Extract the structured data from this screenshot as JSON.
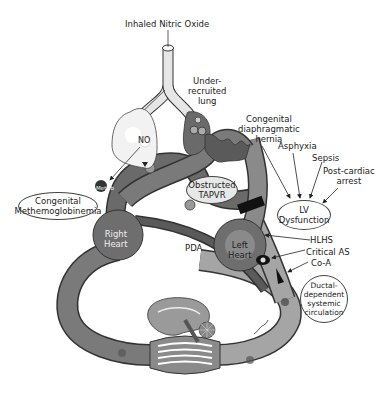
{
  "diagram": {
    "labels": {
      "inhaled_no": "Inhaled Nitric Oxide",
      "under_recruited": [
        "Under-",
        "recruited",
        "lung"
      ],
      "cdh": [
        "Congenital",
        "diaphragmatic",
        "hernia"
      ],
      "asphyxia": "Asphyxia",
      "sepsis": "Sepsis",
      "post_cardiac": [
        "Post-cardiac",
        "arrest"
      ],
      "lv_dysfunction": [
        "LV",
        "Dysfunction"
      ],
      "no": "NO",
      "methb": "MetHb",
      "congenital_methb": [
        "Congenital",
        "Methemoglobinemia"
      ],
      "obstructed_tapvr": [
        "Obstructed",
        "TAPVR"
      ],
      "right_heart": [
        "Right",
        "Heart"
      ],
      "left_heart": [
        "Left",
        "Heart"
      ],
      "pda": "PDA",
      "hlhs": "HLHS",
      "critical_as": "Critical AS",
      "coa": "Co-A",
      "ductal": [
        "Ductal-",
        "dependent",
        "systemic",
        "circulation"
      ]
    },
    "colors": {
      "dark_vessel": "#5a5a5a",
      "mid_vessel": "#8a8a8a",
      "light_vessel": "#a9a9a9",
      "heart": "#6e6e6e",
      "outline": "#333333"
    }
  }
}
